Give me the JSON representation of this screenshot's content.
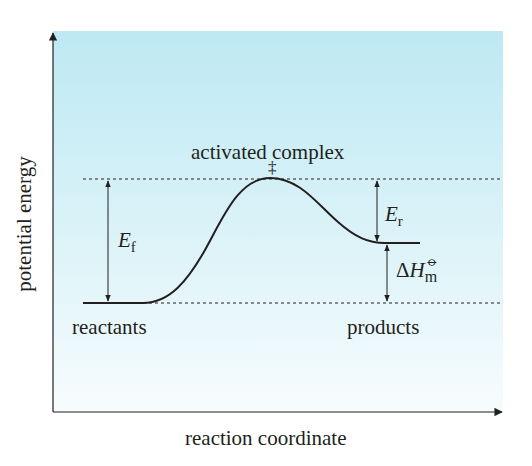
{
  "diagram": {
    "type": "energy-profile",
    "background_gradient": {
      "top": "#bde9f3",
      "bottom": "#f6fcfd"
    },
    "line_color": "#231f20",
    "axes": {
      "x_label": "reaction coordinate",
      "y_label": "potential energy"
    },
    "labels": {
      "transition_state": "activated complex",
      "transition_state_symbol": "‡",
      "reactants": "reactants",
      "products": "products",
      "forward_activation": {
        "symbol": "E",
        "subscript": "f"
      },
      "reverse_activation": {
        "symbol": "E",
        "subscript": "r"
      },
      "enthalpy_change": {
        "delta": "Δ",
        "symbol": "H",
        "superscript": "⦵",
        "subscript": "m"
      }
    },
    "levels": {
      "reactants_energy": 0,
      "transition_state_energy": 1.0,
      "products_energy": 0.48
    }
  }
}
